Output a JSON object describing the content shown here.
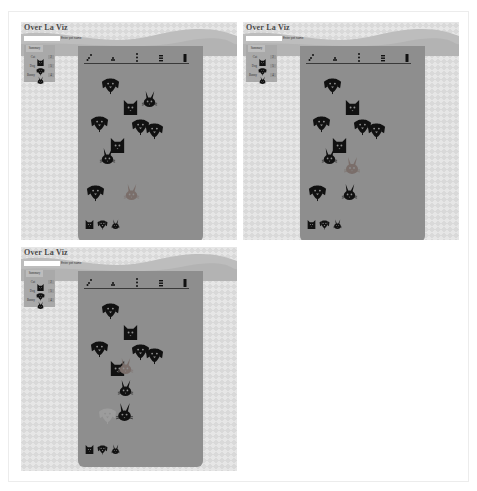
{
  "app": {
    "title": "Over La Viz",
    "input": {
      "value": "",
      "placeholder": ""
    },
    "button_label": "Enter pet name"
  },
  "legend": {
    "header": "Summary",
    "rows": [
      {
        "label": "Cat",
        "icon": "cat-icon",
        "count": "2"
      },
      {
        "label": "Dog",
        "icon": "dog-icon",
        "count": "5"
      },
      {
        "label": "Bunny",
        "icon": "bunny-icon",
        "count": "4"
      }
    ]
  },
  "toolbar": {
    "tools": [
      {
        "name": "scatter-layout-icon"
      },
      {
        "name": "cluster-layout-icon"
      },
      {
        "name": "column-layout-icon"
      },
      {
        "name": "stack-layout-icon"
      },
      {
        "name": "bar-layout-icon"
      }
    ]
  },
  "colors": {
    "banner": "#c7c7c7",
    "viz_bg": "#8e8e8e",
    "icon": "#111111",
    "highlight": "#7a6e6a",
    "faded": "#9c9c9c"
  },
  "panels": [
    {
      "id": "panel-1",
      "animals": [
        {
          "type": "dog",
          "x": 23,
          "y": 30,
          "s": 19,
          "tone": "dark"
        },
        {
          "type": "cat",
          "x": 43,
          "y": 52,
          "s": 19,
          "tone": "dark"
        },
        {
          "type": "bunny",
          "x": 62,
          "y": 44,
          "s": 19,
          "tone": "dark"
        },
        {
          "type": "dog",
          "x": 12,
          "y": 68,
          "s": 19,
          "tone": "dark"
        },
        {
          "type": "dog",
          "x": 53,
          "y": 71,
          "s": 19,
          "tone": "dark"
        },
        {
          "type": "dog",
          "x": 67,
          "y": 75,
          "s": 19,
          "tone": "dark"
        },
        {
          "type": "cat",
          "x": 30,
          "y": 90,
          "s": 19,
          "tone": "dark"
        },
        {
          "type": "bunny",
          "x": 20,
          "y": 101,
          "s": 19,
          "tone": "dark"
        },
        {
          "type": "dog",
          "x": 8,
          "y": 137,
          "s": 19,
          "tone": "dark"
        },
        {
          "type": "bunny",
          "x": 44,
          "y": 137,
          "s": 19,
          "tone": "highlight"
        }
      ],
      "footer": [
        "cat",
        "dog",
        "bunny"
      ]
    },
    {
      "id": "panel-2",
      "animals": [
        {
          "type": "dog",
          "x": 23,
          "y": 30,
          "s": 19,
          "tone": "dark"
        },
        {
          "type": "cat",
          "x": 43,
          "y": 52,
          "s": 19,
          "tone": "dark"
        },
        {
          "type": "dog",
          "x": 12,
          "y": 68,
          "s": 19,
          "tone": "dark"
        },
        {
          "type": "dog",
          "x": 53,
          "y": 71,
          "s": 19,
          "tone": "dark"
        },
        {
          "type": "dog",
          "x": 67,
          "y": 75,
          "s": 19,
          "tone": "dark"
        },
        {
          "type": "cat",
          "x": 30,
          "y": 90,
          "s": 19,
          "tone": "dark"
        },
        {
          "type": "bunny",
          "x": 20,
          "y": 101,
          "s": 19,
          "tone": "dark"
        },
        {
          "type": "bunny",
          "x": 42,
          "y": 110,
          "s": 20,
          "tone": "highlight"
        },
        {
          "type": "dog",
          "x": 8,
          "y": 137,
          "s": 19,
          "tone": "dark"
        },
        {
          "type": "bunny",
          "x": 40,
          "y": 137,
          "s": 19,
          "tone": "dark"
        }
      ],
      "footer": [
        "cat",
        "dog",
        "bunny"
      ]
    },
    {
      "id": "panel-3",
      "animals": [
        {
          "type": "dog",
          "x": 23,
          "y": 30,
          "s": 19,
          "tone": "dark"
        },
        {
          "type": "cat",
          "x": 43,
          "y": 52,
          "s": 19,
          "tone": "dark"
        },
        {
          "type": "dog",
          "x": 12,
          "y": 68,
          "s": 19,
          "tone": "dark"
        },
        {
          "type": "dog",
          "x": 53,
          "y": 71,
          "s": 19,
          "tone": "dark"
        },
        {
          "type": "dog",
          "x": 67,
          "y": 75,
          "s": 19,
          "tone": "dark"
        },
        {
          "type": "cat",
          "x": 30,
          "y": 88,
          "s": 19,
          "tone": "dark"
        },
        {
          "type": "bunny",
          "x": 38,
          "y": 86,
          "s": 19,
          "tone": "highlight"
        },
        {
          "type": "bunny",
          "x": 38,
          "y": 108,
          "s": 19,
          "tone": "dark"
        },
        {
          "type": "dog",
          "x": 20,
          "y": 135,
          "s": 19,
          "tone": "faded"
        },
        {
          "type": "bunny",
          "x": 36,
          "y": 131,
          "s": 21,
          "tone": "dark"
        }
      ],
      "footer": [
        "cat",
        "dog",
        "bunny"
      ]
    }
  ]
}
